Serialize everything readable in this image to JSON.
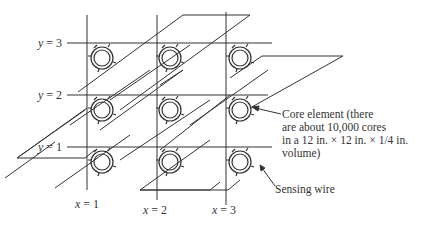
{
  "diagram": {
    "type": "magnetic-core-memory-array",
    "y_labels": [
      {
        "var": "y",
        "eq": " = 3"
      },
      {
        "var": "y",
        "eq": " = 2"
      },
      {
        "var": "y",
        "eq": " = 1"
      }
    ],
    "x_labels": [
      {
        "var": "x",
        "eq": " = 1"
      },
      {
        "var": "x",
        "eq": " = 2"
      },
      {
        "var": "x",
        "eq": " = 3"
      }
    ],
    "annotations": {
      "core_element": [
        "Core element (there",
        "are about 10,000 cores",
        "in a 12 in. × 12 in. × 1/4 in.",
        "volume)"
      ],
      "sensing_wire": "Sensing wire"
    },
    "grid": {
      "rows": 3,
      "cols": 3
    },
    "colors": {
      "line": "#333333",
      "background": "#ffffff"
    }
  }
}
